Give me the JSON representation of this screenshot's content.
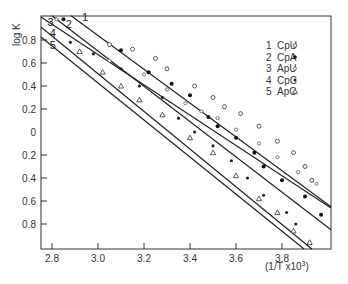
{
  "chart_data": {
    "type": "scatter",
    "title": "",
    "xlabel": "(1/T x10³)",
    "ylabel": "log K",
    "xlim": [
      2.75,
      4.02
    ],
    "ylim": [
      -1.02,
      1.01
    ],
    "grid": false,
    "legend_position": "upper right (inside)",
    "x_ticks": [
      2.8,
      3.0,
      3.2,
      3.4,
      3.6,
      3.8
    ],
    "x_tick_labels": [
      "2.8",
      "3.0",
      "3.2",
      "3.4",
      "3.6",
      "3.8"
    ],
    "y_ticks": [
      0.8,
      0.6,
      0.4,
      0.2,
      0,
      -0.2,
      -0.4,
      -0.6,
      -0.8
    ],
    "y_tick_labels": [
      "0.8",
      "0.6",
      "0.4",
      "0.2",
      "0",
      "0.2",
      "0.4",
      "0.6",
      "0.8"
    ],
    "series": [
      {
        "id": "1",
        "name": "CpU",
        "marker": "open-circle",
        "line": [
          [
            2.883,
            1.01
          ],
          [
            4.013,
            -0.65
          ]
        ],
        "points": [
          [
            3.05,
            0.76
          ],
          [
            3.15,
            0.72
          ],
          [
            3.25,
            0.64
          ],
          [
            3.3,
            0.55
          ],
          [
            3.42,
            0.4
          ],
          [
            3.5,
            0.3
          ],
          [
            3.55,
            0.22
          ],
          [
            3.62,
            0.16
          ],
          [
            3.7,
            0.05
          ],
          [
            3.78,
            -0.08
          ],
          [
            3.85,
            -0.18
          ],
          [
            3.9,
            -0.3
          ],
          [
            3.93,
            -0.42
          ]
        ]
      },
      {
        "id": "2",
        "name": "CpA",
        "marker": "filled-circle",
        "line": [
          [
            2.8,
            1.01
          ],
          [
            4.013,
            -0.85
          ]
        ],
        "points": [
          [
            2.85,
            0.98
          ],
          [
            3.1,
            0.71
          ],
          [
            3.22,
            0.52
          ],
          [
            3.32,
            0.42
          ],
          [
            3.4,
            0.32
          ],
          [
            3.48,
            0.13
          ],
          [
            3.52,
            0.05
          ],
          [
            3.6,
            -0.05
          ],
          [
            3.68,
            -0.18
          ],
          [
            3.72,
            -0.3
          ],
          [
            3.8,
            -0.42
          ],
          [
            3.9,
            -0.56
          ],
          [
            3.97,
            -0.72
          ]
        ]
      },
      {
        "id": "3",
        "name": "ApU",
        "marker": "open-circle-small",
        "line": [
          [
            2.752,
            1.0
          ],
          [
            4.013,
            -0.66
          ]
        ],
        "points": [
          [
            2.82,
            0.98
          ],
          [
            3.05,
            0.62
          ],
          [
            3.2,
            0.5
          ],
          [
            3.3,
            0.37
          ],
          [
            3.38,
            0.25
          ],
          [
            3.45,
            0.18
          ],
          [
            3.52,
            0.12
          ],
          [
            3.6,
            0.02
          ],
          [
            3.7,
            -0.1
          ],
          [
            3.78,
            -0.22
          ],
          [
            3.87,
            -0.35
          ],
          [
            3.95,
            -0.45
          ]
        ]
      },
      {
        "id": "4",
        "name": "CpC",
        "marker": "filled-circle-small",
        "line": [
          [
            2.752,
            0.913
          ],
          [
            3.93,
            -1.017
          ]
        ],
        "points": [
          [
            2.88,
            0.78
          ],
          [
            2.98,
            0.68
          ],
          [
            3.1,
            0.55
          ],
          [
            3.18,
            0.4
          ],
          [
            3.28,
            0.3
          ],
          [
            3.35,
            0.12
          ],
          [
            3.42,
            0.0
          ],
          [
            3.5,
            -0.12
          ],
          [
            3.58,
            -0.25
          ],
          [
            3.65,
            -0.4
          ],
          [
            3.72,
            -0.55
          ],
          [
            3.82,
            -0.7
          ],
          [
            3.86,
            -0.8
          ]
        ]
      },
      {
        "id": "5",
        "name": "ApC",
        "marker": "open-triangle",
        "line": [
          [
            2.752,
            0.826
          ],
          [
            3.896,
            -1.017
          ]
        ],
        "points": [
          [
            2.92,
            0.7
          ],
          [
            3.02,
            0.52
          ],
          [
            3.1,
            0.4
          ],
          [
            3.18,
            0.28
          ],
          [
            3.28,
            0.15
          ],
          [
            3.4,
            -0.05
          ],
          [
            3.5,
            -0.18
          ],
          [
            3.6,
            -0.38
          ],
          [
            3.7,
            -0.58
          ],
          [
            3.78,
            -0.7
          ],
          [
            3.85,
            -0.86
          ],
          [
            3.92,
            -0.96
          ]
        ]
      }
    ],
    "line_labels": [
      {
        "text": "1",
        "x": 2.93,
        "y": 1.0
      },
      {
        "text": "2",
        "x": 2.86,
        "y": 0.94
      },
      {
        "text": "3",
        "x": 2.78,
        "y": 0.96
      },
      {
        "text": "4",
        "x": 2.79,
        "y": 0.86
      },
      {
        "text": "5",
        "x": 2.79,
        "y": 0.76
      }
    ]
  },
  "legend": {
    "items": [
      {
        "num": "1",
        "label": "CpU",
        "symbol": "○"
      },
      {
        "num": "2",
        "label": "CpA",
        "symbol": "●"
      },
      {
        "num": "3",
        "label": "ApU",
        "symbol": "○"
      },
      {
        "num": "4",
        "label": "CpC",
        "symbol": "●"
      },
      {
        "num": "5",
        "label": "ApC",
        "symbol": "△"
      }
    ]
  },
  "axes": {
    "ylabel": "log K",
    "xlabel_main": "(1/T x10",
    "xlabel_sup": "3",
    "xlabel_end": ")"
  }
}
